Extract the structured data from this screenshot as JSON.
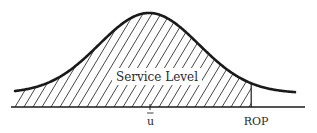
{
  "diagram": {
    "type": "normal-distribution-service-level",
    "region_label": "Service Level",
    "mean_label": "u",
    "mean_label_has_overbar": true,
    "reorder_point_label": "ROP",
    "shaded_region": "left of ROP",
    "reorder_point_z": 1.4,
    "line_color": "#1a1a1a",
    "hatch_color": "#333333",
    "text_color": "#2a2a2a"
  }
}
